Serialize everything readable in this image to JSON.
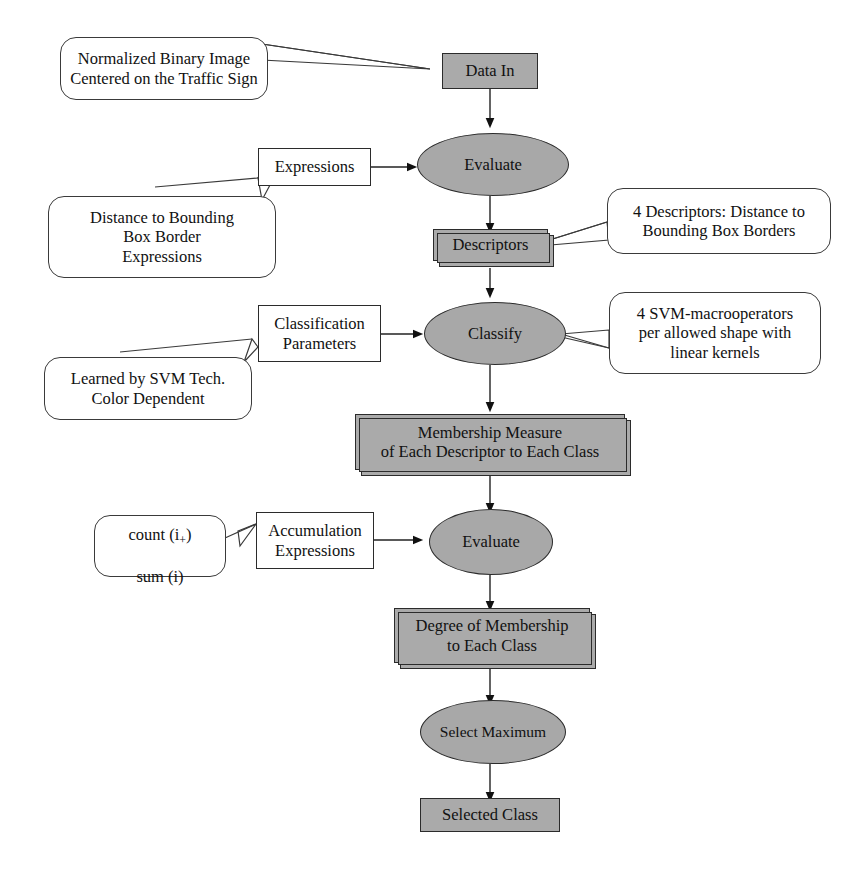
{
  "diagram": {
    "colors": {
      "process_fill": "#aaaaaa",
      "operator_fill": "#a8a8a8",
      "stroke": "#2b2b2b",
      "callout_fill": "#ffffff",
      "background": "#ffffff"
    }
  },
  "nodes": {
    "data_in": "Data In",
    "evaluate_1": "Evaluate",
    "descriptors": "Descriptors",
    "classify": "Classify",
    "membership_measure": "Membership Measure\nof Each Descriptor to Each Class",
    "evaluate_2": "Evaluate",
    "degree_membership": "Degree of Membership\nto Each Class",
    "select_maximum": "Select Maximum",
    "selected_class": "Selected Class"
  },
  "parameters": {
    "expressions": "Expressions",
    "classification_parameters": "Classification\nParameters",
    "accumulation_expressions": "Accumulation\nExpressions"
  },
  "callouts": {
    "input_description": "Normalized Binary Image\nCentered on the Traffic Sign",
    "expression_description": "Distance to Bounding\nBox Border\nExpressions",
    "descriptor_description": "4 Descriptors:  Distance to\nBounding Box Borders",
    "parameter_source": "Learned by SVM Tech.\nColor Dependent",
    "svm_description": "4 SVM-macrooperators\nper allowed shape with\nlinear kernels",
    "accumulation_functions_line1_pre": "count (i",
    "accumulation_functions_line1_sub": "+",
    "accumulation_functions_line1_post": ")",
    "accumulation_functions_line2": "sum (i)"
  }
}
